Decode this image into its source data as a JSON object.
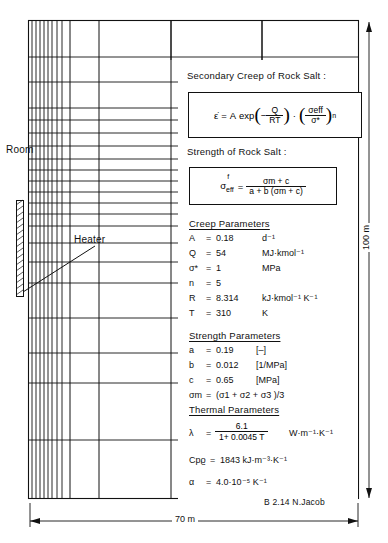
{
  "diagram": {
    "title_block_credit": "B 2.14  N.Jacob",
    "labels": {
      "room": "Room",
      "heater": "Heater",
      "width_dim": "70 m",
      "height_dim": "100 m"
    }
  },
  "panels": {
    "creep_heading": "Secondary Creep of Rock Salt :",
    "strength_heading": "Strength of Rock Salt :",
    "creep_params_heading": "Creep Parameters",
    "strength_params_heading": "Strength Parameters",
    "thermal_params_heading": "Thermal Parameters"
  },
  "equations": {
    "creep": {
      "lhs": "ε̇",
      "eq": "=",
      "a": "A",
      "exp": "exp",
      "minus": "−",
      "num1": "Q",
      "den1": "RT",
      "dot": "·",
      "num2": "σeff",
      "den2": "σ*",
      "pow": "n"
    },
    "strength": {
      "lhs_sym": "σ",
      "lhs_sub": "eff",
      "lhs_sup": "f",
      "eq": "=",
      "num": "σm + c",
      "den": "a + b  (σm + c)"
    }
  },
  "creep_params": [
    {
      "symbol": "A",
      "eq": "=",
      "value": "0.18",
      "unit": "d⁻¹"
    },
    {
      "symbol": "Q",
      "eq": "=",
      "value": "54",
      "unit": "MJ·kmol⁻¹"
    },
    {
      "symbol": "σ*",
      "eq": "=",
      "value": "1",
      "unit": "MPa"
    },
    {
      "symbol": "n",
      "eq": "=",
      "value": "5",
      "unit": ""
    },
    {
      "symbol": "R",
      "eq": "=",
      "value": "8.314",
      "unit": "kJ·kmol⁻¹ K⁻¹"
    },
    {
      "symbol": "T",
      "eq": "=",
      "value": "310",
      "unit": "K"
    }
  ],
  "strength_params": [
    {
      "symbol": "a",
      "eq": "=",
      "value": "0.19",
      "unit": "[–]"
    },
    {
      "symbol": "b",
      "eq": "=",
      "value": "0.012",
      "unit": "[1/MPa]"
    },
    {
      "symbol": "c",
      "eq": "=",
      "value": "0.65",
      "unit": "[MPa]"
    },
    {
      "symbol": "σm",
      "eq": "=",
      "value": "(σ1 + σ2 + σ3 )/3",
      "unit": ""
    }
  ],
  "thermal_params": {
    "lambda_symbol": "λ",
    "lambda_eq": "=",
    "lambda_num": "6.1",
    "lambda_den": "1+ 0.0045 T",
    "lambda_unit": "W·m⁻¹·K⁻¹",
    "cp_symbol": "Cpϱ",
    "cp_eq": "=",
    "cp_value": "1843 kJ·m⁻³·K⁻¹",
    "alpha_symbol": "α",
    "alpha_eq": "=",
    "alpha_value": "4.0·10⁻⁵ K⁻¹"
  },
  "mesh": {
    "outer": {
      "x": 28,
      "y": 20,
      "w": 330,
      "h": 478
    },
    "dense_verticals": [
      30,
      34,
      38,
      42,
      46,
      50,
      54,
      58,
      62
    ],
    "coarse_verticals": [
      66,
      99,
      171,
      262
    ],
    "horizontals": [
      20,
      57,
      82,
      108,
      120,
      133,
      146,
      159,
      170,
      181,
      192,
      203,
      214,
      226,
      243,
      262,
      283,
      318,
      353,
      383,
      440,
      498
    ],
    "heater_block": {
      "x": 16,
      "y": 200,
      "w": 7,
      "h": 97
    }
  },
  "colors": {
    "ink": "#111111",
    "paper": "#ffffff"
  }
}
